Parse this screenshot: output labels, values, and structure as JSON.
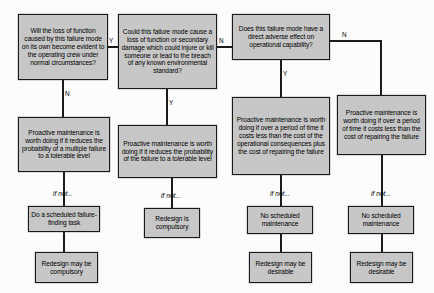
{
  "diagram": {
    "colors": {
      "box_fill": "#c9c9c9",
      "box_border": "#1a1a1a",
      "line": "#1c1c1c",
      "text": "#000000",
      "background": "#ffffff"
    },
    "columns": [
      {
        "id": "hidden-failure",
        "question": "Will the loss of function caused by this failure mode on its own become evident to the operating crew under normal circumstances?",
        "branch_label": "N",
        "policy": "Proactive maintenance is worth doing if it reduces the probability of a multiple failure to a tolerable level",
        "if_not_label": "if not...",
        "action": "Do a scheduled failure-finding task",
        "outcome": "Redesign may be compulsory"
      },
      {
        "id": "safety-environmental",
        "question": "Could this failure mode cause a loss of function or secondary damage which could injure or kill someone or lead to the breach of any known environmental standard?",
        "branch_label": "Y",
        "policy": "Proactive maintenance is worth doing if it reduces the probability of the failure to a tolerable level",
        "if_not_label": "if not...",
        "action": "Redesign is compulsory",
        "outcome": null
      },
      {
        "id": "operational",
        "question": "Does this failure mode have a direct adverse effect on operational capability?",
        "branch_label": "Y",
        "policy": "Proactive maintenance is worth doing if over a period of time it costs less than the cost of the operational consequences plus the cost of repairing the failure",
        "if_not_label": "if not...",
        "action": "No scheduled maintenance",
        "outcome": "Redesign may be desirable"
      },
      {
        "id": "non-operational",
        "question": null,
        "branch_label": "N",
        "policy": "Proactive maintenance is worth doing if over a period of time it costs less than the cost of repairing the failure",
        "if_not_label": "if not...",
        "action": "No scheduled maintenance",
        "outcome": "Redesign may be desirable"
      }
    ],
    "edge_labels": {
      "q1_to_q2": "Y",
      "q2_to_q3": "N",
      "q1_down": "N",
      "q2_down": "Y",
      "q3_down": "Y",
      "q3_right": "N"
    }
  }
}
